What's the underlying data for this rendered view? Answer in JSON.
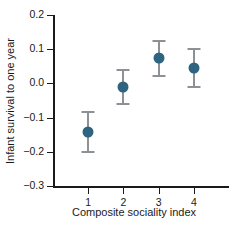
{
  "chart_data": {
    "type": "scatter",
    "title": "",
    "xlabel": "Composite sociality index",
    "ylabel": "Infant survival to one year",
    "categories": [
      "1",
      "2",
      "3",
      "4"
    ],
    "x": [
      1,
      2,
      3,
      4
    ],
    "values": [
      -0.142,
      -0.011,
      0.075,
      0.045
    ],
    "error_low": [
      -0.2,
      -0.06,
      0.022,
      -0.01
    ],
    "error_high": [
      -0.085,
      0.038,
      0.123,
      0.1
    ],
    "ylim": [
      -0.3,
      0.2
    ],
    "ytick_labels": [
      "0.2",
      "0.1",
      "0.0",
      "−0.1",
      "−0.2",
      "−0.3"
    ],
    "ytick_values": [
      0.2,
      0.1,
      0.0,
      -0.1,
      -0.2,
      -0.3
    ],
    "xtick_labels": [
      "1",
      "2",
      "3",
      "4"
    ],
    "grid": false,
    "legend": "none",
    "marker_color": "#2e6480",
    "errorbar_color": "#8d9196",
    "axis_color": "#1a1a1a"
  }
}
